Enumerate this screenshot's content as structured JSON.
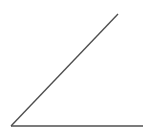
{
  "figure": {
    "kind": "geometry-diagram",
    "background_color": "#ffffff",
    "width": 152,
    "height": 135,
    "labels": [],
    "annotations": []
  },
  "chart_data": {
    "type": "line",
    "title": "",
    "subtitle": "",
    "xlabel": "",
    "ylabel": "",
    "grid": false,
    "legend": null,
    "xlim": [
      0,
      152
    ],
    "ylim": [
      0,
      135
    ],
    "axis_visible": false,
    "tick_labels": [],
    "annotations": [],
    "shape": "acute-angle",
    "vertex": {
      "x": 11,
      "y": 126
    },
    "angle_degrees": 40,
    "series": [
      {
        "name": "horizontal-ray",
        "stroke": "#4f4f4f",
        "stroke_width": 1.4,
        "x": [
          11,
          143
        ],
        "y": [
          126,
          126
        ]
      },
      {
        "name": "diagonal-ray",
        "stroke": "#4f4f4f",
        "stroke_width": 1.4,
        "x": [
          11,
          118
        ],
        "y": [
          126,
          14
        ]
      }
    ]
  }
}
